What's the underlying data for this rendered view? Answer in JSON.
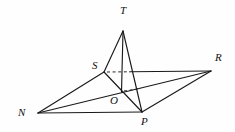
{
  "figure": {
    "background_color": "#fefefe",
    "line_color": "#1a1a1a",
    "label_color": "#111111",
    "width": 235,
    "height": 132,
    "vertices": [
      {
        "id": "T",
        "label": "T",
        "x": 123,
        "y": 31,
        "label_x": 120,
        "label_y": 5,
        "hidden": false
      },
      {
        "id": "S",
        "label": "S",
        "x": 104,
        "y": 72,
        "label_x": 92,
        "label_y": 60,
        "hidden": false
      },
      {
        "id": "R",
        "label": "R",
        "x": 211,
        "y": 71,
        "label_x": 215,
        "label_y": 52,
        "hidden": false
      },
      {
        "id": "O",
        "label": "O",
        "x": 121,
        "y": 92,
        "label_x": 110,
        "label_y": 95,
        "hidden": false
      },
      {
        "id": "N",
        "label": "N",
        "x": 38,
        "y": 113,
        "label_x": 18,
        "label_y": 107,
        "hidden": false
      },
      {
        "id": "P",
        "label": "P",
        "x": 142,
        "y": 112,
        "label_x": 141,
        "label_y": 116,
        "hidden": false
      }
    ],
    "edges": [
      {
        "id": "T-S",
        "from": "T",
        "to": "S",
        "style": "solid",
        "weight": "normal"
      },
      {
        "id": "T-O",
        "from": "T",
        "to": "O",
        "style": "solid",
        "weight": "normal"
      },
      {
        "id": "T-P",
        "from": "T",
        "to": "P",
        "style": "solid",
        "weight": "normal"
      },
      {
        "id": "S-N",
        "from": "S",
        "to": "N",
        "style": "solid",
        "weight": "normal"
      },
      {
        "id": "S-P",
        "from": "S",
        "to": "P",
        "style": "solid",
        "weight": "normal"
      },
      {
        "id": "S-R",
        "from": "S",
        "to": "R",
        "style": "dashed-then-solid",
        "weight": "normal"
      },
      {
        "id": "N-O-R",
        "from": "N",
        "to": "R",
        "style": "solid",
        "weight": "normal"
      },
      {
        "id": "N-P",
        "from": "N",
        "to": "P",
        "style": "solid",
        "weight": "normal"
      },
      {
        "id": "P-R",
        "from": "P",
        "to": "R",
        "style": "solid",
        "weight": "normal"
      },
      {
        "id": "O-dash",
        "from": "O",
        "to": "dash-right",
        "style": "dashed",
        "weight": "thin"
      }
    ],
    "dashed_segments": [
      {
        "id": "S-right-dash",
        "x1": 106,
        "y1": 72,
        "x2": 130,
        "y2": 72
      },
      {
        "id": "O-right-dash",
        "x1": 124,
        "y1": 91,
        "x2": 142,
        "y2": 89
      }
    ]
  }
}
